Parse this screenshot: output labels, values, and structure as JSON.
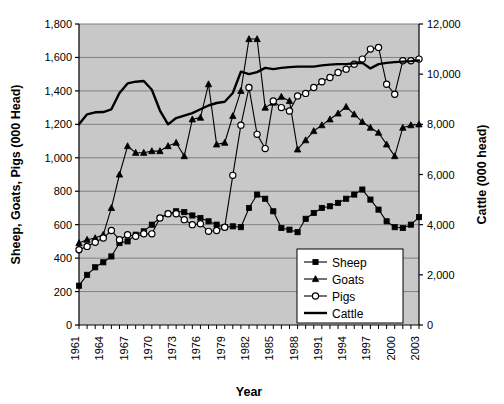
{
  "chart_data": {
    "type": "line",
    "title": "",
    "xlabel": "Year",
    "ylabel": "Sheep, Goats, Pigs (000 Head)",
    "y2label": "Cattle (000 head)",
    "xlim": [
      1961,
      2003
    ],
    "ylim": [
      0,
      1800
    ],
    "y2lim": [
      0,
      12000
    ],
    "ytick_interval": 200,
    "y2tick_interval": 2000,
    "xtick_interval": 1,
    "xlabel_interval": 3,
    "grid": true,
    "plot_bgcolor": "#c8c8c8",
    "legend_position": "bottom-right",
    "yticks": [
      "0",
      "200",
      "400",
      "600",
      "800",
      "1,000",
      "1,200",
      "1,400",
      "1,600",
      "1,800"
    ],
    "y2ticks": [
      "0",
      "2,000",
      "4,000",
      "6,000",
      "8,000",
      "10,000",
      "12,000"
    ],
    "xticks": [
      "1961",
      "1964",
      "1967",
      "1970",
      "1973",
      "1976",
      "1979",
      "1982",
      "1985",
      "1988",
      "1991",
      "1994",
      "1997",
      "2000",
      "2003"
    ],
    "x": [
      1961,
      1962,
      1963,
      1964,
      1965,
      1966,
      1967,
      1968,
      1969,
      1970,
      1971,
      1972,
      1973,
      1974,
      1975,
      1976,
      1977,
      1978,
      1979,
      1980,
      1981,
      1982,
      1983,
      1984,
      1985,
      1986,
      1987,
      1988,
      1989,
      1990,
      1991,
      1992,
      1993,
      1994,
      1995,
      1996,
      1997,
      1998,
      1999,
      2000,
      2001,
      2002,
      2003
    ],
    "series": [
      {
        "name": "Sheep",
        "axis": "left",
        "marker": "filled-square",
        "color": "#000000",
        "values": [
          235,
          300,
          345,
          375,
          410,
          490,
          500,
          540,
          560,
          600,
          640,
          665,
          680,
          675,
          655,
          640,
          620,
          600,
          585,
          590,
          585,
          700,
          780,
          755,
          680,
          580,
          570,
          555,
          635,
          670,
          700,
          710,
          730,
          755,
          780,
          810,
          750,
          690,
          620,
          585,
          580,
          600,
          645
        ]
      },
      {
        "name": "Goats",
        "axis": "left",
        "marker": "filled-triangle",
        "color": "#000000",
        "values": [
          490,
          510,
          520,
          540,
          700,
          900,
          1070,
          1030,
          1030,
          1040,
          1040,
          1070,
          1090,
          1010,
          1230,
          1240,
          1440,
          1080,
          1090,
          1250,
          1400,
          1710,
          1710,
          1300,
          1330,
          1365,
          1340,
          1050,
          1105,
          1160,
          1195,
          1230,
          1265,
          1305,
          1260,
          1215,
          1180,
          1150,
          1080,
          1010,
          1180,
          1195,
          1200
        ]
      },
      {
        "name": "Pigs",
        "axis": "left",
        "marker": "open-circle",
        "color": "#000000",
        "values": [
          450,
          470,
          495,
          520,
          565,
          510,
          540,
          530,
          545,
          545,
          640,
          665,
          665,
          630,
          600,
          605,
          560,
          565,
          585,
          895,
          1195,
          1420,
          1140,
          1055,
          1340,
          1300,
          1280,
          1370,
          1385,
          1420,
          1455,
          1480,
          1510,
          1530,
          1560,
          1590,
          1650,
          1660,
          1440,
          1380,
          1580,
          1580,
          1590
        ]
      },
      {
        "name": "Cattle",
        "axis": "right",
        "marker": "none",
        "color": "#000000",
        "values": [
          8000,
          8400,
          8480,
          8490,
          8600,
          9250,
          9630,
          9700,
          9730,
          9380,
          8550,
          8000,
          8250,
          8350,
          8450,
          8600,
          8750,
          8850,
          8900,
          9250,
          10100,
          10000,
          10080,
          10250,
          10200,
          10250,
          10280,
          10300,
          10300,
          10300,
          10350,
          10380,
          10400,
          10400,
          10430,
          10450,
          10230,
          10400,
          10450,
          10480,
          10500,
          10520,
          10550
        ]
      }
    ]
  },
  "legend": {
    "items": [
      {
        "label": "Sheep",
        "marker": "filled-square"
      },
      {
        "label": "Goats",
        "marker": "filled-triangle"
      },
      {
        "label": "Pigs",
        "marker": "open-circle"
      },
      {
        "label": "Cattle",
        "marker": "line"
      }
    ]
  }
}
